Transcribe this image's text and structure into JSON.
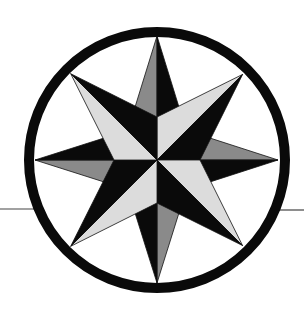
{
  "figure": {
    "width": 304,
    "height": 316,
    "colors": {
      "background": "#ffffff",
      "ring": "#0a0a0a",
      "black": "#0a0a0a",
      "gray": "#8a8a8a",
      "light": "#dcdcdc",
      "line": "#444444"
    },
    "center": {
      "x": 157,
      "y": 160
    },
    "ring": {
      "radius": 128,
      "stroke_width": 10
    },
    "horizon_line": {
      "left": {
        "x1": 0,
        "x2": 34,
        "y": 209
      },
      "right": {
        "x1": 276,
        "x2": 304,
        "y": 210
      }
    },
    "cardinal_points": [
      {
        "name": "north",
        "angle": -90,
        "tip_radius": 124,
        "base_radius": 58,
        "base_spread": 22,
        "left_fill": "gray",
        "right_fill": "black"
      },
      {
        "name": "east",
        "angle": 0,
        "tip_radius": 121,
        "base_radius": 58,
        "base_spread": 22,
        "left_fill": "gray",
        "right_fill": "black"
      },
      {
        "name": "south",
        "angle": 90,
        "tip_radius": 123,
        "base_radius": 58,
        "base_spread": 22,
        "left_fill": "gray",
        "right_fill": "black"
      },
      {
        "name": "west",
        "angle": 180,
        "tip_radius": 122,
        "base_radius": 58,
        "base_spread": 22,
        "left_fill": "gray",
        "right_fill": "black"
      }
    ],
    "diagonal_points": [
      {
        "name": "northeast",
        "angle": -45,
        "tip_radius": 121,
        "base_radius": 43,
        "left_fill": "light",
        "right_fill": "black"
      },
      {
        "name": "southeast",
        "angle": 45,
        "tip_radius": 121,
        "base_radius": 43,
        "left_fill": "light",
        "right_fill": "black"
      },
      {
        "name": "southwest",
        "angle": 135,
        "tip_radius": 122,
        "base_radius": 43,
        "left_fill": "light",
        "right_fill": "black"
      },
      {
        "name": "northwest",
        "angle": -135,
        "tip_radius": 122,
        "base_radius": 43,
        "left_fill": "light",
        "right_fill": "black"
      }
    ]
  }
}
